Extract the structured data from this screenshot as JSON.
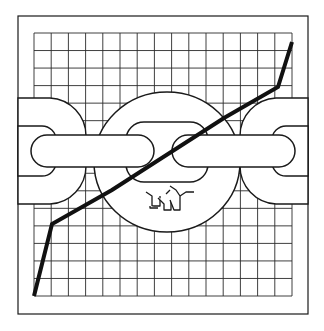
{
  "illustration": {
    "title": "Chain link handshake over rising line chart",
    "colors": {
      "background": "#ffffff",
      "ink": "#1a1a1a",
      "grid": "#2a2a2a"
    },
    "frame": {
      "x": 18,
      "y": 16,
      "width": 290,
      "height": 298
    },
    "grid": {
      "x": 34,
      "y": 33,
      "width": 258,
      "height": 263,
      "columns": 15,
      "rows": 15
    },
    "icons": [
      "chain-link-icon",
      "handshake-icon",
      "line-chart-icon",
      "grid-icon"
    ]
  },
  "chart_data": {
    "type": "line",
    "title": "",
    "xlabel": "",
    "ylabel": "",
    "grid": true,
    "legend": "none",
    "series": [
      {
        "name": "trend",
        "points_px": [
          [
            34,
            296
          ],
          [
            52,
            224
          ],
          [
            112,
            190
          ],
          [
            224,
            118
          ],
          [
            278,
            87
          ],
          [
            292,
            42
          ]
        ],
        "x_grid_units": [
          0,
          1,
          4.5,
          11,
          14,
          15
        ],
        "y_grid_units": [
          0,
          4.3,
          6.3,
          10.5,
          12.4,
          15
        ]
      }
    ],
    "xlim": [
      0,
      15
    ],
    "ylim": [
      0,
      15
    ]
  }
}
